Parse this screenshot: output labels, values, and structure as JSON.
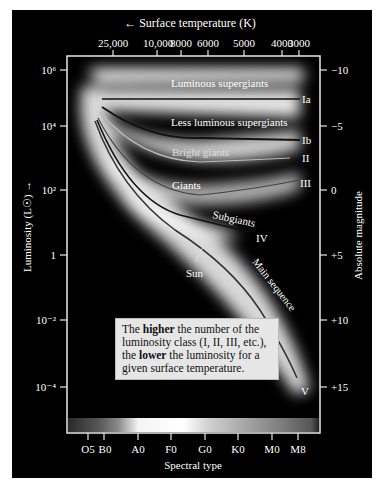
{
  "diagram": {
    "title_top_axis": "Surface temperature (K)",
    "top_axis_arrow": "←",
    "temperature_ticks": [
      "25,000",
      "10,000",
      "8000",
      "6000",
      "5000",
      "4000",
      "3000"
    ],
    "left_axis_label": "Luminosity (L☉)",
    "left_axis_arrow": "→",
    "luminosity_ticks": [
      "10⁶",
      "10⁴",
      "10²",
      "1",
      "10⁻²",
      "10⁻⁴"
    ],
    "right_axis_label": "Absolute magnitude",
    "magnitude_ticks": [
      "−10",
      "−5",
      "0",
      "+5",
      "+10",
      "+15"
    ],
    "bottom_axis_label": "Spectral type",
    "spectral_ticks": [
      "O5",
      "B0",
      "A0",
      "F0",
      "G0",
      "K0",
      "M0",
      "M8"
    ],
    "region_labels": {
      "luminous_supergiants": "Luminous supergiants",
      "less_luminous_supergiants": "Less luminous supergiants",
      "bright_giants": "Bright giants",
      "giants": "Giants",
      "subgiants": "Subgiants",
      "main_sequence": "Main sequence",
      "sun": "Sun"
    },
    "class_labels": {
      "Ia": "Ia",
      "Ib": "Ib",
      "II": "II",
      "III": "III",
      "IV": "IV",
      "V": "V"
    },
    "note": {
      "part1": "The ",
      "bold1": "higher",
      "part2": " the number of the luminosity class (I, II, III, etc.), the ",
      "bold2": "lower",
      "part3": " the luminosity for a given surface temperature."
    },
    "colors": {
      "background": "#000000",
      "axis": "#e8e8e8",
      "text": "#ffffff",
      "note_bg": "#e6e6e6"
    }
  }
}
